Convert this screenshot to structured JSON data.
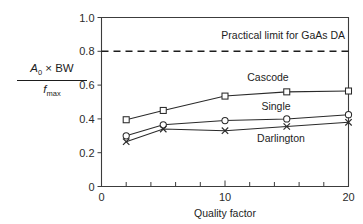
{
  "chart_data": {
    "type": "line",
    "title": "",
    "xlabel": "Quality factor",
    "ylabel_numerator": "A0 × BW",
    "ylabel_denominator": "fmax",
    "xlim": [
      0,
      20
    ],
    "ylim": [
      0,
      1.0
    ],
    "grid": false,
    "legend_position": "inline-right",
    "x_ticks": [
      0,
      2,
      4,
      6,
      8,
      10,
      12,
      14,
      16,
      18,
      20
    ],
    "x_tick_labels": [
      "0",
      "",
      "",
      "",
      "",
      "10",
      "",
      "",
      "",
      "",
      "20"
    ],
    "y_ticks": [
      0,
      0.2,
      0.4,
      0.6,
      0.8,
      1.0
    ],
    "y_tick_labels": [
      "0",
      "0.2",
      "0.4",
      "0.6",
      "0.8",
      "1.0"
    ],
    "x": [
      2,
      5,
      10,
      15,
      20
    ],
    "series": [
      {
        "name": "Cascode",
        "marker": "square",
        "values": [
          0.395,
          0.45,
          0.535,
          0.56,
          0.565
        ]
      },
      {
        "name": "Single",
        "marker": "circle",
        "values": [
          0.3,
          0.365,
          0.39,
          0.4,
          0.425
        ]
      },
      {
        "name": "Darlington",
        "marker": "cross",
        "values": [
          0.265,
          0.34,
          0.33,
          0.355,
          0.38
        ]
      }
    ],
    "annotations": [
      {
        "name": "practical-limit",
        "text": "Practical limit for GaAs DA",
        "y_value": 0.8,
        "style": "dashed-horizontal-line"
      }
    ]
  },
  "colors": {
    "axis": "#3c3c3c",
    "data": "#2a2a2a",
    "text": "#1d1d1d",
    "background": "#ffffff"
  }
}
